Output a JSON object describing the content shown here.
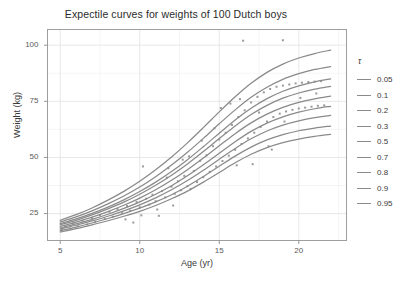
{
  "chart_data": {
    "type": "line",
    "title": "Expectile curves for weights of 100 Dutch boys",
    "xlabel": "Age (yr)",
    "ylabel": "Weight (kg)",
    "xlim": [
      4.2,
      23.0
    ],
    "ylim": [
      13.0,
      107.0
    ],
    "xticks": [
      5,
      10,
      15,
      20
    ],
    "xticklabels": [
      "5",
      "10",
      "15",
      "20"
    ],
    "yticks": [
      25,
      50,
      75,
      100
    ],
    "yticklabels": [
      "25",
      "50",
      "75",
      "100"
    ],
    "grid": true,
    "legend": {
      "title": "τ",
      "position": "right",
      "entries": [
        "0.05",
        "0.1",
        "0.2",
        "0.3",
        "0.5",
        "0.7",
        "0.8",
        "0.9",
        "0.95"
      ],
      "line_color": "#8a8a8a"
    },
    "line_color": "#8a8a8a",
    "point_color": "#9a9a9a",
    "x": [
      5,
      6,
      7,
      8,
      9,
      10,
      11,
      12,
      13,
      14,
      15,
      16,
      17,
      18,
      19,
      20,
      21,
      22
    ],
    "series": [
      {
        "name": "0.05",
        "values": [
          16.8,
          18.3,
          20.0,
          21.8,
          23.8,
          26.0,
          28.6,
          31.6,
          35.0,
          39.0,
          43.3,
          47.6,
          51.4,
          54.4,
          56.6,
          58.2,
          59.4,
          60.3
        ]
      },
      {
        "name": "0.1",
        "values": [
          17.4,
          19.0,
          20.8,
          22.8,
          25.0,
          27.4,
          30.2,
          33.4,
          37.2,
          41.5,
          46.1,
          50.6,
          54.6,
          57.8,
          60.2,
          61.9,
          63.1,
          64.0
        ]
      },
      {
        "name": "0.2",
        "values": [
          18.1,
          19.8,
          21.7,
          23.8,
          26.2,
          28.9,
          32.0,
          35.6,
          39.7,
          44.3,
          49.2,
          54.0,
          58.3,
          61.8,
          64.4,
          66.3,
          67.7,
          68.7
        ]
      },
      {
        "name": "0.3",
        "values": [
          18.6,
          20.4,
          22.4,
          24.7,
          27.3,
          30.2,
          33.6,
          37.4,
          41.8,
          46.7,
          51.9,
          57.0,
          61.6,
          65.3,
          68.1,
          70.2,
          71.7,
          72.8
        ]
      },
      {
        "name": "0.5",
        "values": [
          19.3,
          21.2,
          23.4,
          25.9,
          28.7,
          31.9,
          35.6,
          39.8,
          44.5,
          49.7,
          55.2,
          60.6,
          65.4,
          69.3,
          72.3,
          74.5,
          76.1,
          77.3
        ]
      },
      {
        "name": "0.7",
        "values": [
          20.0,
          22.0,
          24.4,
          27.1,
          30.1,
          33.6,
          37.6,
          42.1,
          47.1,
          52.6,
          58.4,
          64.0,
          69.1,
          73.2,
          76.4,
          78.7,
          80.4,
          81.7
        ]
      },
      {
        "name": "0.8",
        "values": [
          20.5,
          22.6,
          25.1,
          27.9,
          31.1,
          34.8,
          39.0,
          43.7,
          49.0,
          54.8,
          60.8,
          66.7,
          71.9,
          76.2,
          79.5,
          81.9,
          83.7,
          85.0
        ]
      },
      {
        "name": "0.9",
        "values": [
          21.2,
          23.5,
          26.2,
          29.3,
          32.8,
          36.8,
          41.4,
          46.6,
          52.3,
          58.5,
          65.0,
          71.2,
          76.8,
          81.3,
          84.8,
          87.3,
          89.2,
          90.5
        ]
      },
      {
        "name": "0.95",
        "values": [
          22.0,
          24.5,
          27.5,
          31.0,
          34.9,
          39.4,
          44.5,
          50.2,
          56.5,
          63.3,
          70.3,
          77.0,
          83.0,
          87.9,
          91.6,
          94.3,
          96.3,
          97.8
        ]
      }
    ],
    "scatter": [
      [
        5.1,
        17.8
      ],
      [
        5.3,
        19.2
      ],
      [
        5.6,
        18.4
      ],
      [
        5.8,
        20.6
      ],
      [
        6.1,
        19.4
      ],
      [
        6.4,
        21.8
      ],
      [
        6.7,
        20.2
      ],
      [
        7.0,
        23.0
      ],
      [
        7.2,
        21.4
      ],
      [
        7.5,
        24.3
      ],
      [
        7.8,
        22.6
      ],
      [
        8.1,
        25.8
      ],
      [
        8.3,
        23.6
      ],
      [
        8.6,
        27.0
      ],
      [
        8.9,
        25.2
      ],
      [
        9.2,
        28.4
      ],
      [
        9.4,
        26.3
      ],
      [
        9.6,
        21.0
      ],
      [
        9.8,
        30.2
      ],
      [
        10.0,
        27.8
      ],
      [
        10.2,
        46.0
      ],
      [
        10.4,
        31.6
      ],
      [
        10.6,
        29.0
      ],
      [
        10.8,
        33.4
      ],
      [
        11.0,
        30.5
      ],
      [
        11.2,
        24.0
      ],
      [
        11.4,
        35.0
      ],
      [
        11.6,
        32.2
      ],
      [
        11.8,
        45.2
      ],
      [
        12.0,
        37.0
      ],
      [
        12.2,
        33.8
      ],
      [
        12.4,
        39.4
      ],
      [
        12.6,
        35.4
      ],
      [
        12.8,
        41.8
      ],
      [
        13.0,
        37.2
      ],
      [
        13.2,
        36.0
      ],
      [
        13.4,
        44.0
      ],
      [
        13.6,
        39.0
      ],
      [
        13.8,
        48.5
      ],
      [
        14.0,
        41.2
      ],
      [
        14.2,
        51.0
      ],
      [
        14.4,
        43.6
      ],
      [
        14.6,
        55.0
      ],
      [
        14.8,
        46.0
      ],
      [
        15.0,
        58.0
      ],
      [
        15.2,
        48.4
      ],
      [
        15.4,
        61.0
      ],
      [
        15.6,
        50.8
      ],
      [
        15.8,
        64.5
      ],
      [
        16.0,
        53.4
      ],
      [
        16.2,
        68.0
      ],
      [
        16.4,
        56.0
      ],
      [
        16.5,
        102.0
      ],
      [
        16.6,
        71.0
      ],
      [
        16.8,
        58.5
      ],
      [
        17.0,
        74.5
      ],
      [
        17.2,
        61.0
      ],
      [
        17.4,
        77.0
      ],
      [
        17.6,
        63.6
      ],
      [
        17.8,
        79.0
      ],
      [
        18.0,
        66.0
      ],
      [
        18.2,
        80.5
      ],
      [
        18.4,
        68.0
      ],
      [
        18.6,
        81.5
      ],
      [
        18.8,
        69.5
      ],
      [
        19.0,
        102.2
      ],
      [
        19.0,
        82.0
      ],
      [
        19.2,
        70.5
      ],
      [
        19.4,
        82.5
      ],
      [
        19.6,
        71.2
      ],
      [
        19.8,
        83.0
      ],
      [
        20.0,
        71.8
      ],
      [
        20.2,
        83.3
      ],
      [
        20.4,
        72.2
      ],
      [
        20.6,
        83.6
      ],
      [
        20.8,
        72.6
      ],
      [
        21.0,
        83.8
      ],
      [
        21.2,
        73.0
      ],
      [
        21.4,
        84.0
      ],
      [
        21.6,
        73.2
      ],
      [
        13.1,
        50.5
      ],
      [
        14.7,
        63.0
      ],
      [
        16.1,
        46.5
      ],
      [
        17.1,
        47.0
      ],
      [
        18.1,
        55.0
      ],
      [
        18.3,
        53.5
      ],
      [
        12.1,
        28.6
      ],
      [
        11.1,
        26.8
      ],
      [
        10.1,
        24.2
      ],
      [
        9.1,
        22.4
      ],
      [
        15.1,
        72.0
      ],
      [
        15.7,
        74.0
      ],
      [
        16.3,
        76.0
      ],
      [
        17.5,
        70.0
      ],
      [
        19.1,
        66.0
      ],
      [
        20.1,
        76.5
      ],
      [
        21.1,
        78.5
      ],
      [
        13.9,
        57.5
      ],
      [
        12.7,
        49.0
      ],
      [
        11.7,
        41.0
      ]
    ]
  }
}
